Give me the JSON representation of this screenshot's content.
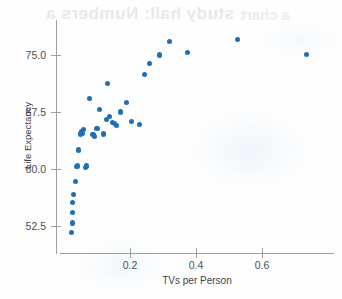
{
  "figure": {
    "ghost_text_top": "study hall: Numbers a",
    "ghost_text_top_2": "a chart",
    "dot_color": "#1f6fb5",
    "axis_color": "#9aa0a6",
    "background_color": "#fefefe"
  },
  "chart_data": {
    "type": "scatter",
    "title": "",
    "xlabel": "TVs per Person",
    "ylabel": "Life Expectancy",
    "xlim": [
      0.0,
      0.8
    ],
    "ylim": [
      50.0,
      78.0
    ],
    "grid": false,
    "legend": null,
    "xticks": [
      "0.2",
      "0.4",
      "0.6"
    ],
    "xtick_values": [
      0.2,
      0.4,
      0.6
    ],
    "yticks": [
      "52.5",
      "60.0",
      "67.5",
      "75.0"
    ],
    "ytick_values": [
      52.5,
      60.0,
      67.5,
      75.0
    ],
    "n_points": 38,
    "x": [
      0.022,
      0.025,
      0.026,
      0.027,
      0.03,
      0.034,
      0.038,
      0.041,
      0.043,
      0.05,
      0.052,
      0.056,
      0.06,
      0.064,
      0.068,
      0.078,
      0.088,
      0.093,
      0.1,
      0.108,
      0.12,
      0.128,
      0.133,
      0.138,
      0.148,
      0.152,
      0.16,
      0.17,
      0.19,
      0.205,
      0.23,
      0.245,
      0.258,
      0.29,
      0.32,
      0.375,
      0.525,
      0.735
    ],
    "y": [
      51.6,
      52.9,
      54.3,
      55.6,
      56.6,
      58.3,
      60.3,
      60.4,
      62.5,
      64.6,
      64.9,
      64.7,
      65.2,
      60.2,
      60.4,
      69.3,
      64.5,
      64.3,
      65.3,
      67.8,
      64.6,
      66.5,
      71.3,
      66.9,
      66.1,
      66.0,
      65.7,
      67.5,
      68.8,
      66.2,
      65.8,
      72.4,
      73.9,
      75.0,
      76.8,
      75.3,
      77.0,
      75.1
    ],
    "points": [
      {
        "x": 0.022,
        "y": 51.6
      },
      {
        "x": 0.025,
        "y": 52.9
      },
      {
        "x": 0.026,
        "y": 54.3
      },
      {
        "x": 0.027,
        "y": 55.6
      },
      {
        "x": 0.03,
        "y": 56.6
      },
      {
        "x": 0.034,
        "y": 58.3
      },
      {
        "x": 0.038,
        "y": 60.3
      },
      {
        "x": 0.041,
        "y": 60.4
      },
      {
        "x": 0.043,
        "y": 62.5
      },
      {
        "x": 0.05,
        "y": 64.6
      },
      {
        "x": 0.052,
        "y": 64.9
      },
      {
        "x": 0.056,
        "y": 64.7
      },
      {
        "x": 0.06,
        "y": 65.2
      },
      {
        "x": 0.064,
        "y": 60.2
      },
      {
        "x": 0.068,
        "y": 60.4
      },
      {
        "x": 0.078,
        "y": 69.3
      },
      {
        "x": 0.088,
        "y": 64.5
      },
      {
        "x": 0.093,
        "y": 64.3
      },
      {
        "x": 0.1,
        "y": 65.3
      },
      {
        "x": 0.108,
        "y": 67.8
      },
      {
        "x": 0.12,
        "y": 64.6
      },
      {
        "x": 0.128,
        "y": 66.5
      },
      {
        "x": 0.133,
        "y": 71.3
      },
      {
        "x": 0.138,
        "y": 66.9
      },
      {
        "x": 0.148,
        "y": 66.1
      },
      {
        "x": 0.152,
        "y": 66.0
      },
      {
        "x": 0.16,
        "y": 65.7
      },
      {
        "x": 0.17,
        "y": 67.5
      },
      {
        "x": 0.19,
        "y": 68.8
      },
      {
        "x": 0.205,
        "y": 66.2
      },
      {
        "x": 0.23,
        "y": 65.8
      },
      {
        "x": 0.245,
        "y": 72.4
      },
      {
        "x": 0.258,
        "y": 73.9
      },
      {
        "x": 0.29,
        "y": 75.0
      },
      {
        "x": 0.32,
        "y": 76.8
      },
      {
        "x": 0.375,
        "y": 75.3
      },
      {
        "x": 0.525,
        "y": 77.0
      },
      {
        "x": 0.735,
        "y": 75.1
      }
    ]
  }
}
